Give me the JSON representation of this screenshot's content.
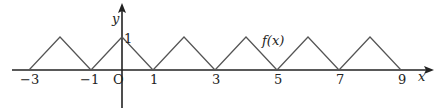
{
  "diagram": {
    "function_label": "f(x)",
    "x_axis_label": "x",
    "y_axis_label": "y",
    "origin_label": "O",
    "peak_label": "1",
    "x_tick_labels": [
      "−3",
      "−1",
      "1",
      "3",
      "5",
      "7",
      "9"
    ],
    "x_tick_values": [
      -3,
      -1,
      1,
      3,
      5,
      7,
      9
    ],
    "peaks_x": [
      -2,
      0,
      2,
      4,
      6,
      8
    ],
    "peak_value": 1,
    "line_color": "#555555",
    "axis_color": "#222222"
  }
}
